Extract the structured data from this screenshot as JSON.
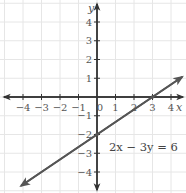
{
  "chart_data": {
    "type": "line",
    "title": "",
    "xlabel": "x",
    "ylabel": "y",
    "xlim": [
      -4.5,
      4.5
    ],
    "ylim": [
      -4.5,
      4.5
    ],
    "grid": true,
    "x_ticks": [
      -4,
      -3,
      -2,
      -1,
      0,
      1,
      2,
      3,
      4
    ],
    "y_ticks": [
      4,
      3,
      2,
      1,
      -1,
      -2,
      -3,
      -4
    ],
    "x_tick_labels": [
      "−4",
      "−3",
      "−2",
      "−1",
      "0",
      "1",
      "2",
      "3",
      "4"
    ],
    "y_tick_labels": [
      "4",
      "3",
      "2",
      "1",
      "−1",
      "−2",
      "−3",
      "−4"
    ],
    "series": [
      {
        "name": "2x − 3y = 6",
        "equation": "2x − 3y = 6",
        "slope": 0.6667,
        "y_intercept": -2,
        "x_intercept": 3,
        "points": [
          [
            -4.1,
            -4.73
          ],
          [
            0,
            -2
          ],
          [
            3,
            0
          ],
          [
            4.6,
            1.07
          ]
        ]
      }
    ],
    "annotations": [
      {
        "text": "2x − 3y = 6",
        "x": 1.9,
        "y": -2.5
      }
    ]
  },
  "colors": {
    "axis": "#333333",
    "line": "#555555",
    "grid": "#e6e6e6",
    "text": "#555555"
  }
}
